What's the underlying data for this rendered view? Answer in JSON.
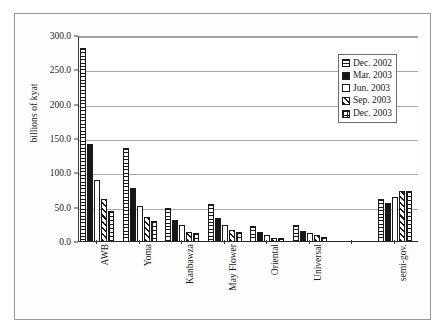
{
  "chart_data": {
    "type": "bar",
    "title": "",
    "xlabel": "",
    "ylabel": "billions of kyat",
    "ylim": [
      0,
      300
    ],
    "ytick_step": 50,
    "ytick_labels": [
      "0.0",
      "50.0",
      "100.0",
      "150.0",
      "200.0",
      "250.0",
      "300.0"
    ],
    "ytick_values": [
      0,
      50,
      100,
      150,
      200,
      250,
      300
    ],
    "grid": true,
    "legend_position": "upper right",
    "categories": [
      "AWB",
      "Yoma",
      "Kanbawza",
      "May Flower",
      "Oriental",
      "Universal",
      "",
      "semi-gov."
    ],
    "series": [
      {
        "name": "Dec. 2002",
        "pattern": "horizontal-stripes",
        "values": [
          283.0,
          136.5,
          50.0,
          55.5,
          23.0,
          25.0,
          null,
          62.0
        ]
      },
      {
        "name": "Mar. 2003",
        "pattern": "solid-black",
        "values": [
          143.0,
          79.0,
          32.5,
          35.5,
          14.5,
          16.5,
          null,
          57.0
        ]
      },
      {
        "name": "Jun. 2003",
        "pattern": "plain-white",
        "values": [
          90.0,
          52.5,
          24.5,
          24.5,
          10.5,
          13.5,
          null,
          65.0
        ]
      },
      {
        "name": "Sep. 2003",
        "pattern": "diagonal-stripes",
        "values": [
          62.0,
          37.0,
          14.0,
          17.5,
          6.0,
          9.5,
          null,
          74.0
        ]
      },
      {
        "name": "Dec. 2003",
        "pattern": "grid-checker",
        "values": [
          45.0,
          30.5,
          12.5,
          14.0,
          5.5,
          7.5,
          null,
          75.0
        ]
      }
    ]
  },
  "legend": {
    "entries": [
      {
        "label": "Dec. 2002"
      },
      {
        "label": "Mar. 2003"
      },
      {
        "label": "Jun. 2003"
      },
      {
        "label": "Sep. 2003"
      },
      {
        "label": "Dec. 2003"
      }
    ]
  },
  "colors": {
    "ink": "#1a1a1a",
    "grid": "#a8a8a8",
    "axis": "#2a2a2a",
    "frame": "#9a9a9a",
    "background": "#ffffff"
  }
}
